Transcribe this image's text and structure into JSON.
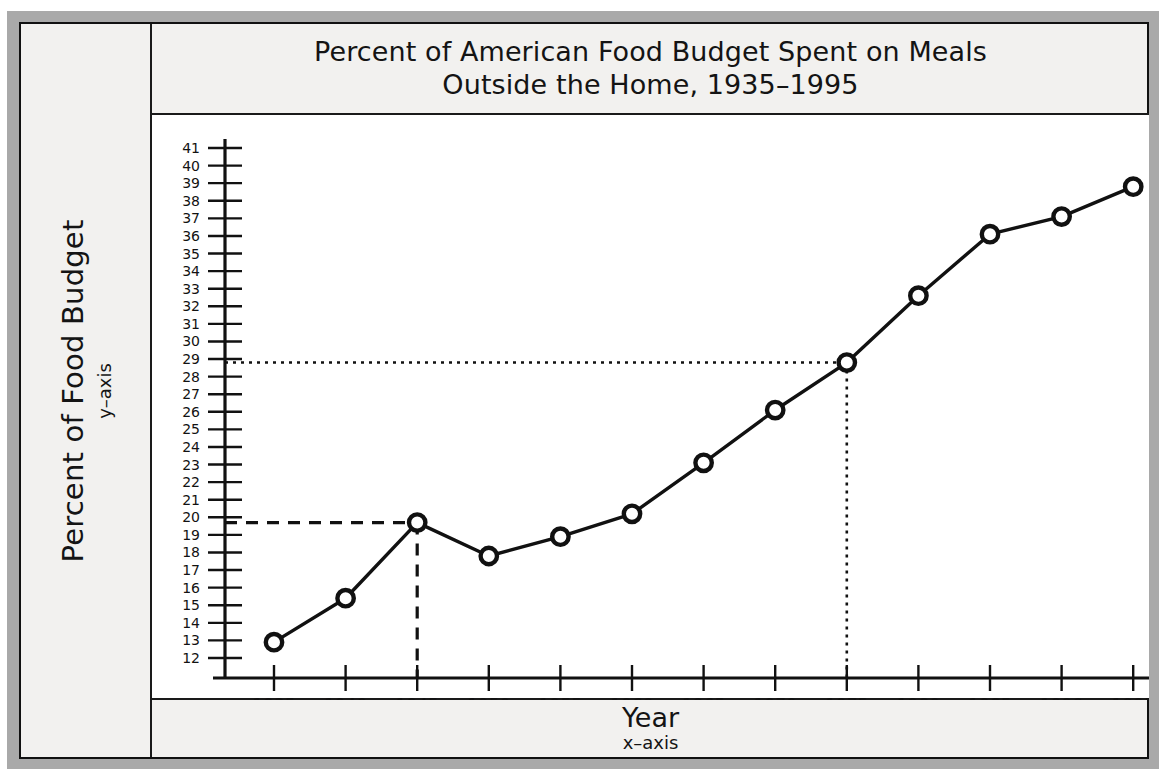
{
  "chart_data": {
    "type": "line",
    "title": "Percent of American Food Budget Spent on Meals Outside the Home, 1935–1995",
    "title_line1": "Percent of American Food Budget Spent on Meals",
    "title_line2": "Outside the Home, 1935–1995",
    "xlabel": "Year",
    "xlabel_sub": "x–axis",
    "ylabel": "Percent of Food Budget",
    "ylabel_sub": "y–axis",
    "x": [
      1935,
      1940,
      1945,
      1950,
      1955,
      1960,
      1965,
      1970,
      1975,
      1980,
      1985,
      1990,
      1995
    ],
    "values": [
      12.9,
      15.4,
      19.7,
      17.8,
      18.9,
      20.2,
      23.1,
      26.1,
      28.8,
      32.6,
      36.1,
      37.1,
      38.8
    ],
    "xtick_labels": [
      "1935",
      "1940",
      "1945",
      "1950",
      "1955",
      "1960",
      "1965",
      "1970",
      "1975",
      "1980",
      "1985",
      "1990",
      "1995"
    ],
    "ytick_labels": [
      "41",
      "40",
      "39",
      "38",
      "37",
      "36",
      "35",
      "34",
      "33",
      "32",
      "31",
      "30",
      "29",
      "28",
      "27",
      "26",
      "25",
      "24",
      "23",
      "22",
      "21",
      "20",
      "19",
      "18",
      "17",
      "16",
      "15",
      "14",
      "13",
      "12"
    ],
    "ylim": [
      12,
      41
    ],
    "xlim": [
      1932.5,
      1996.5
    ],
    "grid": false,
    "legend": null,
    "marker": "open-circle",
    "line_color": "#111111",
    "annotations": [
      {
        "kind": "dashed-reference-line",
        "x": 1945,
        "y": 19.7,
        "style": "dashed",
        "description": "Dashed guide from y-axis to the 1945 data point and down to the x-axis"
      },
      {
        "kind": "dotted-reference-line",
        "x": 1975,
        "y": 28.8,
        "style": "dotted",
        "description": "Dotted guide from y-axis to the 1975 data point and down to the x-axis"
      }
    ]
  },
  "colors": {
    "frame_gray": "#a9a9a9",
    "panel_background": "#f2f1ef",
    "plot_background": "#ffffff",
    "ink": "#141414"
  }
}
